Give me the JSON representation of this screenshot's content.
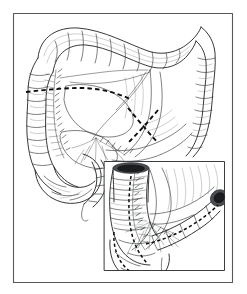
{
  "figure": {
    "title": "Right hemicolectomy resection diagram",
    "subject": "Large intestine (colon) with mesenteric vasculature",
    "style": "black and white medical line illustration",
    "background_color": "#ffffff",
    "ink_color": "#1a1a1a",
    "frame_color": "#55585c",
    "width_px": 247,
    "height_px": 294
  },
  "frame": {
    "name": "outer-border",
    "x": 13,
    "y": 13,
    "width": 220,
    "height": 270,
    "stroke_color": "#55585c"
  },
  "inset": {
    "name": "detail-panel",
    "x": 104,
    "y": 161,
    "width": 121,
    "height": 110,
    "stroke_color": "#3a3d40",
    "label": "Detail view of ileocecal resection"
  },
  "structures": [
    {
      "id": "transverse-colon",
      "label": "Transverse colon",
      "region": "superior arch",
      "feature": "haustra"
    },
    {
      "id": "hepatic-flexure",
      "label": "Hepatic flexure",
      "region": "upper left"
    },
    {
      "id": "splenic-flexure",
      "label": "Splenic flexure",
      "region": "upper right"
    },
    {
      "id": "ascending-colon",
      "label": "Ascending colon",
      "region": "left vertical limb",
      "feature": "haustra"
    },
    {
      "id": "descending-colon",
      "label": "Descending colon",
      "region": "right vertical limb",
      "feature": "haustra"
    },
    {
      "id": "cecum",
      "label": "Cecum",
      "region": "lower left"
    },
    {
      "id": "terminal-ileum",
      "label": "Terminal ileum",
      "region": "lower center"
    },
    {
      "id": "appendix",
      "label": "Appendix",
      "region": "lower left of cecum"
    },
    {
      "id": "mesentery",
      "label": "Mesentery with vascular arcade",
      "region": "central"
    },
    {
      "id": "ileocolic-vessels",
      "label": "Ileocolic vessels",
      "region": "central fan"
    },
    {
      "id": "cut-end-colon",
      "label": "Divided colon stump (open lumen)",
      "region": "inset top left"
    },
    {
      "id": "cut-end-ileum",
      "label": "Divided ileum stump (open lumen)",
      "region": "inset right"
    }
  ],
  "markings": [
    {
      "id": "resection-line-transverse",
      "label": "Dashed resection line across transverse colon and mesentery",
      "style": "dashed",
      "color": "#0d0e10"
    },
    {
      "id": "resection-line-crossed",
      "label": "Crossed dashed division marks on mesenteric vessels",
      "style": "dashed X",
      "color": "#0d0e10"
    },
    {
      "id": "resection-line-ileum",
      "label": "Dashed resection line along terminal ileum",
      "style": "dashed",
      "color": "#0d0e10"
    },
    {
      "id": "resection-line-cecum",
      "label": "Dashed resection line around cecum",
      "style": "dashed",
      "color": "#0d0e10"
    },
    {
      "id": "suture-line",
      "label": "Suture ties along divided mesenteric border",
      "style": "ticked line",
      "color": "#17191b"
    }
  ],
  "annotations": {
    "visible_text": [],
    "note": "No printed labels or captions appear within the image"
  }
}
